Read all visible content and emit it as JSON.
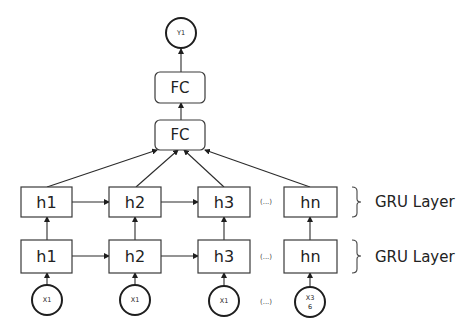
{
  "diagram": {
    "type": "neural-network-architecture",
    "output": {
      "label": "Y1"
    },
    "fc_layers": [
      {
        "label": "FC"
      },
      {
        "label": "FC"
      }
    ],
    "gru_layers": [
      {
        "label": "GRU Layer",
        "cells": [
          {
            "label": "h1"
          },
          {
            "label": "h2"
          },
          {
            "label": "h3"
          },
          {
            "label": "hn"
          }
        ],
        "ellipsis": "(...)"
      },
      {
        "label": "GRU Layer",
        "cells": [
          {
            "label": "h1"
          },
          {
            "label": "h2"
          },
          {
            "label": "h3"
          },
          {
            "label": "hn"
          }
        ],
        "ellipsis": "(...)"
      }
    ],
    "inputs": [
      {
        "label": "X1"
      },
      {
        "label": "X1"
      },
      {
        "label": "X1"
      },
      {
        "label": "X3",
        "label_line2": "6"
      }
    ],
    "inputs_ellipsis": "(...)"
  }
}
